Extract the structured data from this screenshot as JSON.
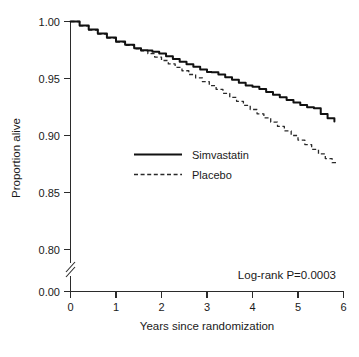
{
  "chart_data": {
    "type": "line",
    "title": "",
    "subtitle": "",
    "xlabel": "Years since randomization",
    "ylabel": "Proportion alive",
    "xlim": [
      0,
      6
    ],
    "ylim": [
      0.78,
      1.0
    ],
    "grid": false,
    "y_axis_break": true,
    "y_break_between": [
      0.0,
      0.78
    ],
    "xticks": [
      0,
      1,
      2,
      3,
      4,
      5,
      6
    ],
    "xticklabels": [
      "0",
      "1",
      "2",
      "3",
      "4",
      "5",
      "6"
    ],
    "yticks": [
      0.0,
      0.8,
      0.85,
      0.9,
      0.95,
      1.0
    ],
    "yticklabels": [
      "0.00",
      "0.80",
      "0.85",
      "0.90",
      "0.95",
      "1.00"
    ],
    "legend_position": "center",
    "legend_entries": [
      "Simvastatin",
      "Placebo"
    ],
    "annotations": [
      "Log-rank P=0.0003"
    ],
    "series": [
      {
        "name": "Simvastatin",
        "style": "solid",
        "color": "#111111",
        "x": [
          0.0,
          0.2,
          0.4,
          0.6,
          0.8,
          1.0,
          1.2,
          1.4,
          1.55,
          1.7,
          1.8,
          1.95,
          2.1,
          2.25,
          2.4,
          2.55,
          2.7,
          2.85,
          3.0,
          3.1,
          3.25,
          3.4,
          3.55,
          3.7,
          3.85,
          4.0,
          4.15,
          4.3,
          4.45,
          4.6,
          4.75,
          4.9,
          5.05,
          5.2,
          5.35,
          5.5,
          5.65,
          5.8
        ],
        "y": [
          1.0,
          0.9965,
          0.993,
          0.9895,
          0.986,
          0.9825,
          0.9795,
          0.9765,
          0.9748,
          0.9745,
          0.9735,
          0.972,
          0.9695,
          0.9672,
          0.9648,
          0.9625,
          0.9602,
          0.958,
          0.9558,
          0.9555,
          0.9535,
          0.9512,
          0.9488,
          0.9462,
          0.9438,
          0.9428,
          0.9408,
          0.9382,
          0.9358,
          0.9335,
          0.9312,
          0.929,
          0.9268,
          0.9248,
          0.9238,
          0.9188,
          0.9152,
          0.9122
        ]
      },
      {
        "name": "Placebo",
        "style": "dashed",
        "color": "#2a2a2a",
        "x": [
          0.0,
          0.2,
          0.4,
          0.6,
          0.8,
          1.0,
          1.2,
          1.4,
          1.55,
          1.7,
          1.85,
          2.0,
          2.15,
          2.3,
          2.45,
          2.6,
          2.75,
          2.9,
          3.05,
          3.2,
          3.35,
          3.5,
          3.65,
          3.8,
          3.95,
          4.1,
          4.25,
          4.4,
          4.55,
          4.7,
          4.85,
          5.0,
          5.15,
          5.3,
          5.45,
          5.6,
          5.75,
          5.85
        ],
        "y": [
          1.0,
          0.9962,
          0.9925,
          0.989,
          0.9855,
          0.982,
          0.979,
          0.976,
          0.9742,
          0.9718,
          0.9688,
          0.9658,
          0.9628,
          0.9598,
          0.9568,
          0.9535,
          0.9505,
          0.9472,
          0.9438,
          0.9405,
          0.937,
          0.9335,
          0.93,
          0.9265,
          0.9228,
          0.919,
          0.9155,
          0.9118,
          0.908,
          0.904,
          0.9,
          0.896,
          0.892,
          0.8878,
          0.8838,
          0.8798,
          0.8762,
          0.8748
        ]
      }
    ]
  },
  "axes": {
    "y_title": "Proportion alive",
    "x_title": "Years since randomization"
  },
  "legend": {
    "items": [
      {
        "label": "Simvastatin",
        "style": "solid"
      },
      {
        "label": "Placebo",
        "style": "dashed"
      }
    ]
  },
  "annotation": {
    "log_rank": "Log-rank P=0.0003"
  },
  "ytick_labels": {
    "t0": "1.00",
    "t1": "0.95",
    "t2": "0.90",
    "t3": "0.85",
    "t4": "0.80",
    "t5": "0.00"
  },
  "xtick_labels": {
    "t0": "0",
    "t1": "1",
    "t2": "2",
    "t3": "3",
    "t4": "4",
    "t5": "5",
    "t6": "6"
  },
  "colors": {
    "simvastatin": "#111111",
    "placebo": "#2a2a2a",
    "axis": "#2b2b2b",
    "background": "#ffffff"
  }
}
